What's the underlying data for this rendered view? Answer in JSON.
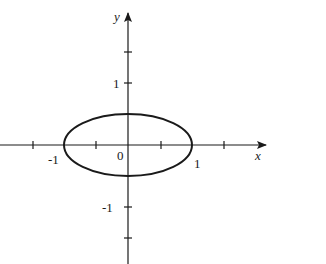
{
  "figure": {
    "axes": {
      "x_label": "x",
      "y_label": "y",
      "x_ticks": [
        "-1",
        "0",
        "1"
      ],
      "y_ticks": [
        "1",
        "-1"
      ],
      "origin_label": "0"
    },
    "curve": {
      "type": "ellipse",
      "center": [
        0,
        0
      ],
      "semi_major_x": 1,
      "semi_minor_y": 0.5
    },
    "colors": {
      "stroke": "#1a1a1a",
      "background": "#ffffff"
    }
  }
}
